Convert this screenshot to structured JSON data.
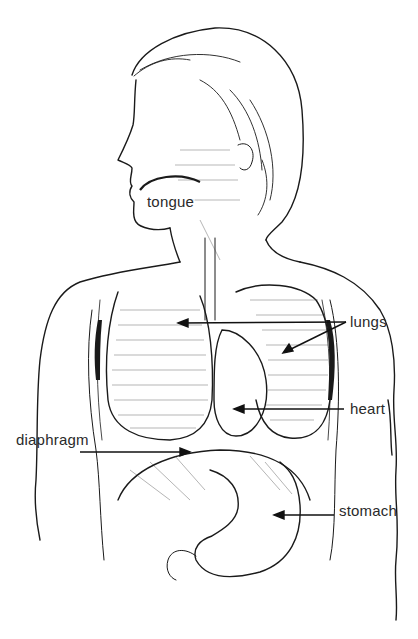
{
  "diagram": {
    "colors": {
      "ink": "#1a1a1a",
      "label": "#2a2a2a",
      "background": "#ffffff"
    },
    "labels": [
      {
        "id": "tongue",
        "text": "tongue"
      },
      {
        "id": "lungs",
        "text": "lungs"
      },
      {
        "id": "heart",
        "text": "heart"
      },
      {
        "id": "diaphragm",
        "text": "diaphragm"
      },
      {
        "id": "stomach",
        "text": "stomach"
      }
    ],
    "arrows": [
      {
        "label": "lungs",
        "targets": [
          "left lung",
          "right lung"
        ],
        "count": 2
      },
      {
        "label": "heart",
        "targets": [
          "heart"
        ],
        "count": 1
      },
      {
        "label": "diaphragm",
        "targets": [
          "diaphragm"
        ],
        "count": 1
      },
      {
        "label": "stomach",
        "targets": [
          "stomach"
        ],
        "count": 1
      }
    ]
  }
}
